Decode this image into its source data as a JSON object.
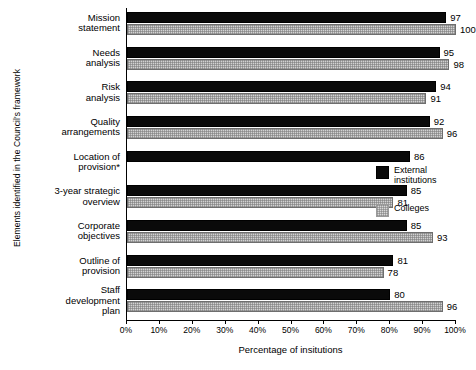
{
  "chart_data": {
    "type": "bar",
    "orientation": "horizontal",
    "title": "",
    "xlabel": "Percentage of insitutions",
    "ylabel": "Elements identified in the Council's framework",
    "xlim": [
      0,
      100
    ],
    "grid": false,
    "legend_position": "right",
    "xticks": [
      "0%",
      "10%",
      "20%",
      "30%",
      "40%",
      "50%",
      "60%",
      "70%",
      "80%",
      "90%",
      "100%"
    ],
    "xtick_values": [
      0,
      10,
      20,
      30,
      40,
      50,
      60,
      70,
      80,
      90,
      100
    ],
    "categories": [
      "Mission\nstatement",
      "Needs\nanalysis",
      "Risk\nanalysis",
      "Quality\narrangements",
      "Location of\nprovision*",
      "3-year strategic\noverview",
      "Corporate\nobjectives",
      "Outline of\nprovision",
      "Staff\ndevelopment\nplan"
    ],
    "series": [
      {
        "name": "External institutions",
        "color": "#0a0a0a",
        "values": [
          97,
          95,
          94,
          92,
          86,
          85,
          85,
          81,
          80
        ]
      },
      {
        "name": "Colleges",
        "color": "#d2d2d2",
        "values": [
          100,
          98,
          91,
          96,
          null,
          81,
          93,
          78,
          96
        ]
      }
    ]
  },
  "legend": {
    "items": [
      {
        "label": "External\ninstitutions",
        "swatch": "external"
      },
      {
        "label": "Colleges",
        "swatch": "colleges"
      }
    ]
  }
}
